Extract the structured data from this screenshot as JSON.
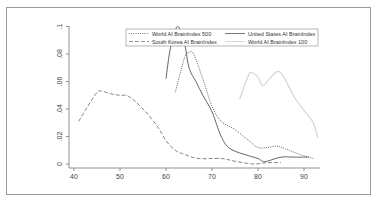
{
  "chart_data": {
    "type": "line",
    "title": "",
    "xlabel": "",
    "ylabel": "",
    "xlim": [
      40,
      93
    ],
    "ylim": [
      0,
      0.1
    ],
    "x_ticks": [
      40,
      50,
      60,
      70,
      80,
      90
    ],
    "x_tick_labels": [
      "40",
      "50",
      "60",
      "70",
      "80",
      "90"
    ],
    "y_ticks": [
      0,
      0.02,
      0.04,
      0.06,
      0.08,
      0.1
    ],
    "y_tick_labels": [
      "0",
      ".02",
      ".04",
      ".06",
      ".08",
      ".1"
    ],
    "grid": false,
    "legend_position": "top-right inside",
    "series": [
      {
        "name": "World AI BrainIndex 500",
        "style": "dotted",
        "color": "#555555",
        "x": [
          62,
          64,
          65,
          66,
          68,
          70,
          72,
          75,
          78,
          80,
          82,
          84,
          86,
          89,
          92
        ],
        "values": [
          0.052,
          0.077,
          0.081,
          0.08,
          0.062,
          0.042,
          0.031,
          0.025,
          0.017,
          0.012,
          0.012,
          0.013,
          0.011,
          0.007,
          0.004
        ]
      },
      {
        "name": "United States AI BrainIndex",
        "style": "solid",
        "color": "#555555",
        "x": [
          60,
          61,
          62.5,
          64,
          65,
          66.5,
          68,
          70,
          72,
          74,
          78,
          80,
          81,
          82,
          85,
          88,
          91
        ],
        "values": [
          0.062,
          0.085,
          0.1,
          0.088,
          0.07,
          0.06,
          0.05,
          0.038,
          0.02,
          0.011,
          0.006,
          0.004,
          0.002,
          0.002,
          0.005,
          0.005,
          0.005
        ]
      },
      {
        "name": "South Korea AI BrainIndex",
        "style": "dashed",
        "color": "#777777",
        "x": [
          41,
          43,
          45,
          46,
          48,
          50,
          52,
          55,
          58,
          60,
          62,
          64,
          67,
          72,
          75,
          79,
          82,
          85
        ],
        "values": [
          0.031,
          0.042,
          0.052,
          0.053,
          0.051,
          0.05,
          0.049,
          0.04,
          0.028,
          0.017,
          0.01,
          0.007,
          0.004,
          0.004,
          0.002,
          0.0,
          0.001,
          0.001
        ]
      },
      {
        "name": "World AI BrainIndex 100",
        "style": "solid-light",
        "color": "#d8d8d8",
        "x": [
          76,
          78,
          79,
          80,
          81,
          82,
          84,
          85,
          86,
          88,
          90,
          92,
          93
        ],
        "values": [
          0.047,
          0.065,
          0.066,
          0.063,
          0.057,
          0.06,
          0.067,
          0.066,
          0.061,
          0.048,
          0.039,
          0.03,
          0.019
        ]
      }
    ]
  },
  "legend": {
    "items": [
      {
        "label": "World AI BrainIndex 500",
        "style": "dotted"
      },
      {
        "label": "United States AI BrainIndex",
        "style": "solid"
      },
      {
        "label": "South Korea AI BrainIndex",
        "style": "dashed"
      },
      {
        "label": "World AI BrainIndex 100",
        "style": "solid-light"
      }
    ]
  }
}
